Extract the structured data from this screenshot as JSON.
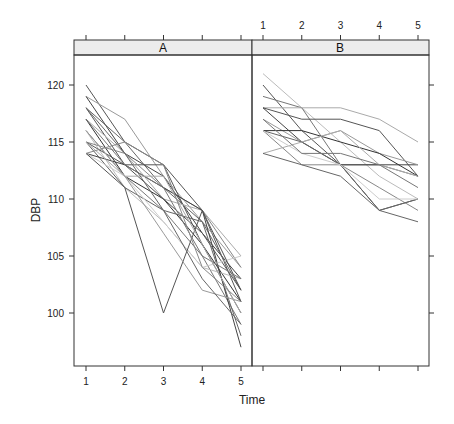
{
  "chart_data": {
    "type": "line",
    "title": "",
    "xlabel": "Time",
    "ylabel": "DBP",
    "x": [
      1,
      2,
      3,
      4,
      5
    ],
    "x_ticks": [
      "1",
      "2",
      "3",
      "4",
      "5"
    ],
    "y_ticks": [
      "100",
      "105",
      "110",
      "115",
      "120"
    ],
    "ylim": [
      95.4,
      122.6
    ],
    "xlim": [
      0.7,
      5.3
    ],
    "grid": false,
    "legend": null,
    "layout": "lattice xyplot, 2 panels side by side, strip labels on top",
    "panels": [
      {
        "name": "A",
        "series": [
          {
            "name": "s1",
            "values": [
              120,
              115,
              113,
              109,
              101
            ],
            "shade": "#555555"
          },
          {
            "name": "s2",
            "values": [
              119,
              117,
              112,
              108,
              104
            ],
            "shade": "#999999"
          },
          {
            "name": "s3",
            "values": [
              119,
              114,
              112,
              107,
              103
            ],
            "shade": "#444444"
          },
          {
            "name": "s4",
            "values": [
              118,
              115,
              111,
              108,
              102
            ],
            "shade": "#666666"
          },
          {
            "name": "s5",
            "values": [
              118,
              113,
              113,
              106,
              100
            ],
            "shade": "#555555"
          },
          {
            "name": "s6",
            "values": [
              117,
              114,
              110,
              109,
              105
            ],
            "shade": "#aaaaaa"
          },
          {
            "name": "s7",
            "values": [
              117,
              112,
              110,
              106,
              101
            ],
            "shade": "#333333"
          },
          {
            "name": "s8",
            "values": [
              116,
              112,
              109,
              105,
              99
            ],
            "shade": "#777777"
          },
          {
            "name": "s9",
            "values": [
              116,
              111,
              108,
              104,
              103
            ],
            "shade": "#bbbbbb"
          },
          {
            "name": "s10",
            "values": [
              115,
              114,
              111,
              109,
              104
            ],
            "shade": "#888888"
          },
          {
            "name": "s11",
            "values": [
              115,
              113,
              110,
              107,
              102
            ],
            "shade": "#555555"
          },
          {
            "name": "s12",
            "values": [
              115,
              111,
              109,
              108,
              98
            ],
            "shade": "#666666"
          },
          {
            "name": "s13",
            "values": [
              114,
              113,
              111,
              109,
              97
            ],
            "shade": "#444444"
          },
          {
            "name": "s14",
            "values": [
              114,
              112,
              108,
              104,
              105
            ],
            "shade": "#cccccc"
          },
          {
            "name": "s15",
            "values": [
              114,
              111,
              100,
              109,
              102
            ],
            "shade": "#555555"
          },
          {
            "name": "s16",
            "values": [
              116,
              112,
              107,
              102,
              101
            ],
            "shade": "#999999"
          },
          {
            "name": "s17",
            "values": [
              117,
              113,
              111,
              105,
              103
            ],
            "shade": "#777777"
          },
          {
            "name": "s18",
            "values": [
              115,
              112,
              112,
              106,
              100
            ],
            "shade": "#aaaaaa"
          },
          {
            "name": "s19",
            "values": [
              118,
              114,
              109,
              103,
              99
            ],
            "shade": "#666666"
          },
          {
            "name": "s20",
            "values": [
              114,
              115,
              113,
              104,
              101
            ],
            "shade": "#888888"
          }
        ]
      },
      {
        "name": "B",
        "series": [
          {
            "name": "s1",
            "values": [
              121,
              118,
              115,
              112,
              110
            ],
            "shade": "#bbbbbb"
          },
          {
            "name": "s2",
            "values": [
              120,
              116,
              113,
              109,
              110
            ],
            "shade": "#555555"
          },
          {
            "name": "s3",
            "values": [
              119,
              118,
              113,
              113,
              112
            ],
            "shade": "#777777"
          },
          {
            "name": "s4",
            "values": [
              118,
              118,
              118,
              117,
              115
            ],
            "shade": "#aaaaaa"
          },
          {
            "name": "s5",
            "values": [
              118,
              117,
              117,
              116,
              112
            ],
            "shade": "#555555"
          },
          {
            "name": "s6",
            "values": [
              118,
              115,
              113,
              113,
              113
            ],
            "shade": "#444444"
          },
          {
            "name": "s7",
            "values": [
              117,
              115,
              116,
              114,
              113
            ],
            "shade": "#999999"
          },
          {
            "name": "s8",
            "values": [
              116,
              115,
              113,
              109,
              108
            ],
            "shade": "#666666"
          },
          {
            "name": "s9",
            "values": [
              116,
              116,
              115,
              114,
              112
            ],
            "shade": "#333333"
          },
          {
            "name": "s10",
            "values": [
              116,
              113,
              113,
              111,
              109
            ],
            "shade": "#888888"
          },
          {
            "name": "s11",
            "values": [
              114,
              115,
              116,
              113,
              112
            ],
            "shade": "#aaaaaa"
          },
          {
            "name": "s12",
            "values": [
              114,
              113,
              112,
              109,
              110
            ],
            "shade": "#666666"
          },
          {
            "name": "s13",
            "values": [
              116,
              114,
              113,
              110,
              110
            ],
            "shade": "#cccccc"
          },
          {
            "name": "s14",
            "values": [
              117,
              114,
              114,
              113,
              111
            ],
            "shade": "#777777"
          }
        ]
      }
    ]
  },
  "axes": {
    "xlabel": "Time",
    "ylabel": "DBP",
    "x_ticks": [
      "1",
      "2",
      "3",
      "4",
      "5"
    ],
    "y_ticks": [
      "100",
      "105",
      "110",
      "115",
      "120"
    ]
  },
  "panels": {
    "a_label": "A",
    "b_label": "B"
  },
  "colors": {
    "strip_fill": "#ececec",
    "frame": "#333333",
    "tick": "#333333"
  }
}
